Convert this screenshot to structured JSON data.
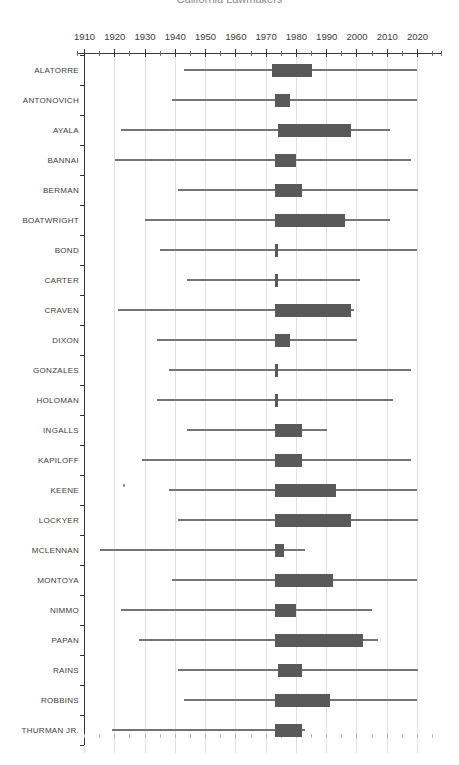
{
  "chart_data": {
    "type": "bar",
    "variant": "horizontal-range-timeline (lifespan line + tenure bar per person)",
    "title": "California Lawmakers",
    "title_note": "title partially cropped at top edge of screenshot",
    "xlabel": "",
    "ylabel": "",
    "x_axis": {
      "decade_ticks": [
        1910,
        1920,
        1930,
        1940,
        1950,
        1960,
        1970,
        1980,
        1990,
        2000,
        2010,
        2020
      ],
      "tick_interval_years": 5,
      "axis_range_years": [
        1907.5,
        2027.5
      ],
      "grid": "vertical light gridlines at each decade",
      "legend_position": "none"
    },
    "rows": [
      {
        "name": "ALATORRE",
        "line": [
          1943,
          2020
        ],
        "bar": [
          1972,
          1985
        ]
      },
      {
        "name": "ANTONOVICH",
        "line": [
          1939,
          2020
        ],
        "bar": [
          1973,
          1978
        ]
      },
      {
        "name": "AYALA",
        "line": [
          1922,
          2011
        ],
        "bar": [
          1974,
          1998
        ]
      },
      {
        "name": "BANNAI",
        "line": [
          1920,
          2018
        ],
        "bar": [
          1973,
          1980
        ]
      },
      {
        "name": "BERMAN",
        "line": [
          1941,
          2020
        ],
        "bar": [
          1973,
          1982
        ]
      },
      {
        "name": "BOATWRIGHT",
        "line": [
          1930,
          2011
        ],
        "bar": [
          1973,
          1996
        ]
      },
      {
        "name": "BOND",
        "line": [
          1935,
          2020
        ],
        "bar": [
          1973,
          1974
        ]
      },
      {
        "name": "CARTER",
        "line": [
          1944,
          2001
        ],
        "bar": [
          1973,
          1974
        ]
      },
      {
        "name": "CRAVEN",
        "line": [
          1921,
          1999
        ],
        "bar": [
          1973,
          1998
        ]
      },
      {
        "name": "DIXON",
        "line": [
          1934,
          2000
        ],
        "bar": [
          1973,
          1978
        ]
      },
      {
        "name": "GONZALES",
        "line": [
          1938,
          2018
        ],
        "bar": [
          1973,
          1974
        ]
      },
      {
        "name": "HOLOMAN",
        "line": [
          1934,
          2012
        ],
        "bar": [
          1973,
          1974
        ]
      },
      {
        "name": "INGALLS",
        "line": [
          1944,
          1990
        ],
        "bar": [
          1973,
          1982
        ]
      },
      {
        "name": "KAPILOFF",
        "line": [
          1929,
          2018
        ],
        "bar": [
          1973,
          1982
        ]
      },
      {
        "name": "KEENE",
        "line": [
          1938,
          2020
        ],
        "bar": [
          1973,
          1993
        ],
        "point": 1923
      },
      {
        "name": "LOCKYER",
        "line": [
          1941,
          2020
        ],
        "bar": [
          1973,
          1998
        ]
      },
      {
        "name": "MCLENNAN",
        "line": [
          1915,
          1983
        ],
        "bar": [
          1973,
          1976
        ]
      },
      {
        "name": "MONTOYA",
        "line": [
          1939,
          2020
        ],
        "bar": [
          1973,
          1992
        ]
      },
      {
        "name": "NIMMO",
        "line": [
          1922,
          2005
        ],
        "bar": [
          1973,
          1980
        ]
      },
      {
        "name": "PAPAN",
        "line": [
          1928,
          2007
        ],
        "bar": [
          1973,
          2002
        ]
      },
      {
        "name": "RAINS",
        "line": [
          1941,
          2020
        ],
        "bar": [
          1974,
          1982
        ]
      },
      {
        "name": "ROBBINS",
        "line": [
          1943,
          2020
        ],
        "bar": [
          1973,
          1991
        ]
      },
      {
        "name": "THURMAN JR.",
        "line": [
          1919,
          1983
        ],
        "bar": [
          1973,
          1982
        ]
      }
    ],
    "colors": {
      "bar": "#595959",
      "lifespan_line": "#757575",
      "gridline": "#e0e0e0",
      "axis": "#3b3b3b",
      "tick_minor": "#6e6e6e",
      "bottom_tick": "#b5b5b5",
      "label": "#3d3d3d",
      "title": "#8a8a8a",
      "background": "#ffffff"
    }
  }
}
